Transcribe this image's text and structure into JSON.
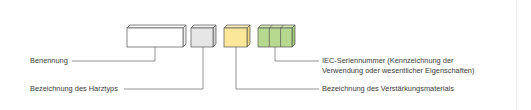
{
  "diagram": {
    "type": "designation-code-breakdown",
    "blocks": [
      {
        "id": "name",
        "color": "#ffffff",
        "segments": 1
      },
      {
        "id": "resin",
        "color": "#e6e6e6",
        "segments": 1
      },
      {
        "id": "reinforcement",
        "color": "#fbe79a",
        "segments": 1
      },
      {
        "id": "series",
        "color": "#b7d98f",
        "segments": 3
      }
    ],
    "labels": {
      "benennung": "Benennung",
      "harztyp": "Bezeichnung des Harztyps",
      "iec_line1": "IEC-Seriennummer (Kennzeichnung der",
      "iec_line2": "Verwendung oder wesentlicher Eigenschaften)",
      "verstaerkung": "Bezeichnung des Verstärkungsmaterials"
    },
    "colors": {
      "stroke": "#555555",
      "line": "#666666",
      "text": "#3a3a3a"
    }
  }
}
